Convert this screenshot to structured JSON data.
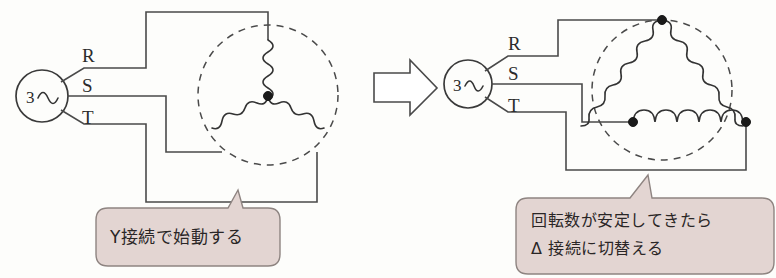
{
  "diagram": {
    "background_color": "#fdfdfb",
    "wire_color": "#4a4a4a",
    "bubble_fill": "#e3d5d2",
    "bubble_stroke": "#8e8481",
    "node_color": "#1a1a1a"
  },
  "left": {
    "caption": "Y接続で始動する",
    "connection_type": "Y",
    "source": {
      "phase_count": "3",
      "waveform_symbol": "∿"
    },
    "phases": [
      {
        "name": "R",
        "label": "R"
      },
      {
        "name": "S",
        "label": "S"
      },
      {
        "name": "T",
        "label": "T"
      }
    ],
    "winding": {
      "coil_count": 3,
      "has_star_point": true
    }
  },
  "transition": {
    "arrow_symbol": "⇒",
    "direction": "right"
  },
  "right": {
    "caption_line1": "回転数が安定してきたら",
    "caption_line2": "Δ 接続に切替える",
    "connection_type": "Δ",
    "source": {
      "phase_count": "3",
      "waveform_symbol": "∿"
    },
    "phases": [
      {
        "name": "R",
        "label": "R"
      },
      {
        "name": "S",
        "label": "S"
      },
      {
        "name": "T",
        "label": "T"
      }
    ],
    "winding": {
      "coil_count": 3,
      "node_count": 3
    }
  }
}
